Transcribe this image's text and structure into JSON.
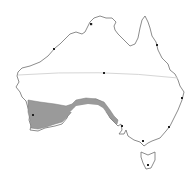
{
  "map": {
    "subject": "Australia distribution map",
    "colors": {
      "background": "#ffffff",
      "outline": "#6e6e6e",
      "range_fill": "#9a9a9a",
      "tropic_line": "#d6d6d6",
      "city_marker": "#222222"
    },
    "range_region": "South-western Western Australia and southern South Australian coast",
    "markers": [
      {
        "name": "darwin",
        "x": 91,
        "y": 24
      },
      {
        "name": "broome",
        "x": 54,
        "y": 49
      },
      {
        "name": "alice-springs",
        "x": 104,
        "y": 73
      },
      {
        "name": "cairns",
        "x": 157,
        "y": 45
      },
      {
        "name": "brisbane",
        "x": 182,
        "y": 98
      },
      {
        "name": "perth",
        "x": 33,
        "y": 115
      },
      {
        "name": "adelaide",
        "x": 122,
        "y": 126
      },
      {
        "name": "sydney",
        "x": 169,
        "y": 127
      },
      {
        "name": "melbourne",
        "x": 143,
        "y": 141
      },
      {
        "name": "hobart",
        "x": 148,
        "y": 165
      }
    ]
  }
}
